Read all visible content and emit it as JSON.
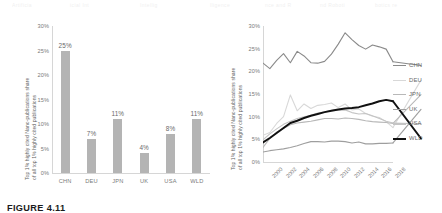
{
  "figure": {
    "caption": "FIGURE 4.11",
    "ghost_text": "Artificial Intelligence and Robotics research output"
  },
  "chart_data": [
    {
      "type": "bar",
      "panel": "left",
      "title": "",
      "categories": [
        "CHN",
        "DEU",
        "JPN",
        "UK",
        "USA",
        "WLD"
      ],
      "values": [
        25,
        7,
        11,
        4,
        8,
        11
      ],
      "data_labels": [
        "25%",
        "7%",
        "11%",
        "4%",
        "8%",
        "11%"
      ],
      "xlabel": "",
      "ylabel": "Top 1% highly cited Nano-publications share of all top 1% highly cited publications",
      "ylabel_line1": "Top 1% highly cited Nano-publications share",
      "ylabel_line2": "of all top 1% highly cited publications",
      "ylim": [
        0,
        30
      ],
      "yticks": [
        0,
        5,
        10,
        15,
        20,
        25,
        30
      ],
      "ytick_labels": [
        "0%",
        "5%",
        "10%",
        "15%",
        "20%",
        "25%",
        "30%"
      ],
      "grid": false,
      "bar_color": "#b4b4b4"
    },
    {
      "type": "line",
      "panel": "right",
      "title": "",
      "xlabel": "",
      "ylabel": "Top 1% highly cited Nano-publications share of all top 1% highly cited publications",
      "ylabel_line1": "Top 1% highly cited Nano-publications share",
      "ylabel_line2": "of all top 1% highly cited publications",
      "ylim": [
        0,
        30
      ],
      "yticks": [
        0,
        5,
        10,
        15,
        20,
        25,
        30
      ],
      "ytick_labels": [
        "0%",
        "5%",
        "10%",
        "15%",
        "20%",
        "25%",
        "30%"
      ],
      "xlim": [
        2000,
        2019
      ],
      "xticks": [
        2000,
        2002,
        2004,
        2006,
        2008,
        2010,
        2012,
        2014,
        2016,
        2018
      ],
      "xtick_labels": [
        "2000",
        "2002",
        "2004",
        "2006",
        "2008",
        "2010",
        "2012",
        "2014",
        "2016",
        "2018"
      ],
      "x": [
        2000,
        2001,
        2002,
        2003,
        2004,
        2005,
        2006,
        2007,
        2008,
        2009,
        2010,
        2011,
        2012,
        2013,
        2014,
        2015,
        2016,
        2017,
        2018,
        2019
      ],
      "grid": false,
      "legend_position": "right",
      "series": [
        {
          "name": "CHN",
          "color": "#8a8a8a",
          "width": 1.1,
          "values": [
            21.8,
            20.6,
            22.4,
            23.9,
            21.9,
            24.4,
            23.4,
            21.9,
            21.8,
            22.2,
            23.8,
            26.0,
            28.5,
            27.0,
            25.7,
            24.9,
            25.8,
            25.4,
            24.9,
            22.1
          ]
        },
        {
          "name": "DEU",
          "color": "#d8d8d8",
          "width": 1.1,
          "values": [
            5.9,
            6.5,
            8.5,
            10.0,
            14.8,
            11.3,
            12.8,
            11.8,
            12.5,
            12.7,
            13.0,
            12.0,
            12.8,
            11.5,
            11.7,
            10.7,
            10.1,
            9.8,
            8.9,
            7.6
          ]
        },
        {
          "name": "JPN",
          "color": "#b8b8b8",
          "width": 1.1,
          "values": [
            3.2,
            5.2,
            6.6,
            7.4,
            8.2,
            8.6,
            8.8,
            9.0,
            9.3,
            9.6,
            9.6,
            9.5,
            9.7,
            9.6,
            9.4,
            9.1,
            8.9,
            8.8,
            8.7,
            8.5
          ]
        },
        {
          "name": "UK",
          "color": "#9e9e9e",
          "width": 1.1,
          "values": [
            2.2,
            2.5,
            2.7,
            2.9,
            3.2,
            3.6,
            4.1,
            4.5,
            4.5,
            4.4,
            4.6,
            4.6,
            4.5,
            4.2,
            4.4,
            4.0,
            4.0,
            4.1,
            4.1,
            4.2
          ]
        },
        {
          "name": "USA",
          "color": "#c4c4c4",
          "width": 1.1,
          "values": [
            4.9,
            6.2,
            7.3,
            8.3,
            9.0,
            9.6,
            10.0,
            10.3,
            10.8,
            11.0,
            11.4,
            11.4,
            11.5,
            10.9,
            10.6,
            10.7,
            10.2,
            9.6,
            9.0,
            8.6
          ]
        },
        {
          "name": "WLD",
          "color": "#111111",
          "width": 2.0,
          "values": [
            4.3,
            5.3,
            6.4,
            7.5,
            8.6,
            9.1,
            9.7,
            10.2,
            10.6,
            11.0,
            11.3,
            11.6,
            11.8,
            11.9,
            12.1,
            12.5,
            12.9,
            13.4,
            13.7,
            13.4
          ]
        }
      ]
    }
  ]
}
